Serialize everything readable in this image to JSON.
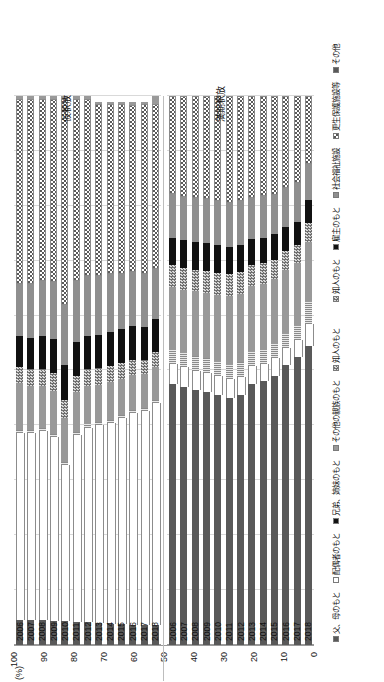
{
  "chart_data": {
    "type": "bar",
    "orientation": "horizontal-stacked-rotated",
    "title": "",
    "xlabel": "",
    "ylabel": "(%)",
    "ylim": [
      0,
      100
    ],
    "yticks": [
      100,
      90,
      80,
      70,
      60,
      50,
      40,
      30,
      20,
      10,
      0
    ],
    "grid": true,
    "legend_position": "bottom",
    "categories": [
      "2006",
      "2007",
      "2008",
      "2009",
      "2010",
      "2011",
      "2012",
      "2013",
      "2014",
      "2015",
      "2016",
      "2017",
      "2018"
    ],
    "panels": [
      {
        "name": "仮釈放",
        "series": [
          {
            "name": "父、母のもと",
            "key": "s-dark",
            "values": [
              4.6,
              4.6,
              4.5,
              4.4,
              4.3,
              4.2,
              4.1,
              4.0,
              3.9,
              3.8,
              3.7,
              3.6,
              3.6
            ]
          },
          {
            "name": "配偶者のもと",
            "key": "s-white",
            "values": [
              34.0,
              34.0,
              34.5,
              33.5,
              28.5,
              34.0,
              35.5,
              36.0,
              36.5,
              37.5,
              38.5,
              39.0,
              40.5
            ]
          },
          {
            "name": "兄弟、姉妹のもと",
            "key": "s-stripe",
            "values": [
              0.6,
              0.6,
              0.6,
              0.6,
              0.6,
              0.6,
              0.6,
              0.6,
              0.6,
              0.6,
              0.6,
              0.6,
              0.6
            ]
          },
          {
            "name": "その他の親族のもと",
            "key": "s-mid",
            "values": [
              8.5,
              8.0,
              7.5,
              7.8,
              8.0,
              7.2,
              7.0,
              6.8,
              7.0,
              6.6,
              6.4,
              6.2,
              6.0
            ]
          },
          {
            "name": "知人のもと",
            "key": "s-check",
            "values": [
              3.0,
              3.0,
              3.2,
              3.2,
              3.2,
              3.0,
              3.0,
              3.0,
              2.8,
              2.8,
              2.8,
              2.6,
              2.6
            ]
          },
          {
            "name": "雇主のもと",
            "key": "s-black",
            "values": [
              5.6,
              5.8,
              6.0,
              6.2,
              6.4,
              6.2,
              6.0,
              6.0,
              6.2,
              6.2,
              6.2,
              6.0,
              6.0
            ]
          },
          {
            "name": "社会福祉施設",
            "key": "s-mid2",
            "values": [
              9.5,
              9.8,
              10.0,
              10.5,
              11.0,
              11.2,
              11.0,
              10.8,
              10.5,
              10.0,
              9.8,
              9.6,
              9.2
            ]
          },
          {
            "name": "更生保護施設等",
            "key": "s-dots",
            "values": [
              33.6,
              33.6,
              33.2,
              33.2,
              37.4,
              33.1,
              32.2,
              31.3,
              31.0,
              31.0,
              30.4,
              31.0,
              30.0
            ]
          },
          {
            "name": "その他",
            "key": "s-mid",
            "values": [
              0.6,
              0.6,
              0.5,
              0.6,
              0.6,
              0.5,
              0.6,
              0.5,
              0.5,
              0.5,
              0.6,
              0.4,
              1.5
            ]
          }
        ]
      },
      {
        "name": "満期釈放",
        "series": [
          {
            "name": "父、母のもと",
            "key": "s-dark",
            "values": [
              47.5,
              47.0,
              46.5,
              46.0,
              45.5,
              45.0,
              45.5,
              47.5,
              48.0,
              49.0,
              51.0,
              52.5,
              54.5
            ]
          },
          {
            "name": "配偶者のもと",
            "key": "s-white",
            "values": [
              3.6,
              3.6,
              3.5,
              3.6,
              3.5,
              3.4,
              3.4,
              3.3,
              3.2,
              3.2,
              3.1,
              3.0,
              4.0
            ]
          },
          {
            "name": "兄弟、姉妹のもと",
            "key": "s-stripe",
            "values": [
              2.6,
              2.6,
              2.6,
              2.6,
              2.6,
              2.6,
              2.6,
              2.6,
              2.6,
              2.6,
              2.6,
              2.6,
              4.0
            ]
          },
          {
            "name": "その他の親族のもと",
            "key": "s-mid",
            "values": [
              11.5,
              11.5,
              11.8,
              12.0,
              12.2,
              12.5,
              12.5,
              12.0,
              12.0,
              11.8,
              11.6,
              11.4,
              11.0
            ]
          },
          {
            "name": "知人のもと",
            "key": "s-check",
            "values": [
              4.0,
              4.0,
              4.0,
              4.0,
              4.0,
              4.0,
              4.0,
              3.8,
              3.8,
              3.6,
              3.5,
              3.4,
              3.4
            ]
          },
          {
            "name": "雇主のもと",
            "key": "s-black",
            "values": [
              5.0,
              5.0,
              5.0,
              5.0,
              5.0,
              5.0,
              4.8,
              4.8,
              4.6,
              4.6,
              4.4,
              4.2,
              4.2
            ]
          },
          {
            "name": "その他",
            "key": "s-mid2",
            "values": [
              8.0,
              8.0,
              8.0,
              8.0,
              8.0,
              8.0,
              8.0,
              7.5,
              7.5,
              7.2,
              7.0,
              7.0,
              6.5
            ]
          },
          {
            "name": "知人のもと2",
            "key": "s-dots",
            "values": [
              17.8,
              18.3,
              18.6,
              18.8,
              19.2,
              19.5,
              19.2,
              18.5,
              18.3,
              18.0,
              16.8,
              15.9,
              12.4
            ]
          }
        ]
      }
    ],
    "legends": [
      {
        "panel": "仮釈放",
        "items": [
          {
            "label": "知人のもと",
            "key": "s-check"
          },
          {
            "label": "雇主のもと",
            "key": "s-black"
          },
          {
            "label": "社会福祉施設",
            "key": "s-mid2"
          },
          {
            "label": "更生保護施設等",
            "key": "s-dots"
          },
          {
            "label": "その他",
            "key": "s-dark"
          }
        ]
      },
      {
        "panel": "満期釈放",
        "items": [
          {
            "label": "父、母のもと",
            "key": "s-dark"
          },
          {
            "label": "配偶者のもと",
            "key": "s-white"
          },
          {
            "label": "兄弟、姉妹のもと",
            "key": "s-black"
          },
          {
            "label": "その他の親族のもと",
            "key": "s-mid"
          },
          {
            "label": "知人のもと",
            "key": "s-check"
          }
        ]
      }
    ]
  },
  "axis": {
    "unit_label": "(%)"
  },
  "panel_titles": {
    "top": "仮釈放",
    "bottom": "満期釈放"
  }
}
